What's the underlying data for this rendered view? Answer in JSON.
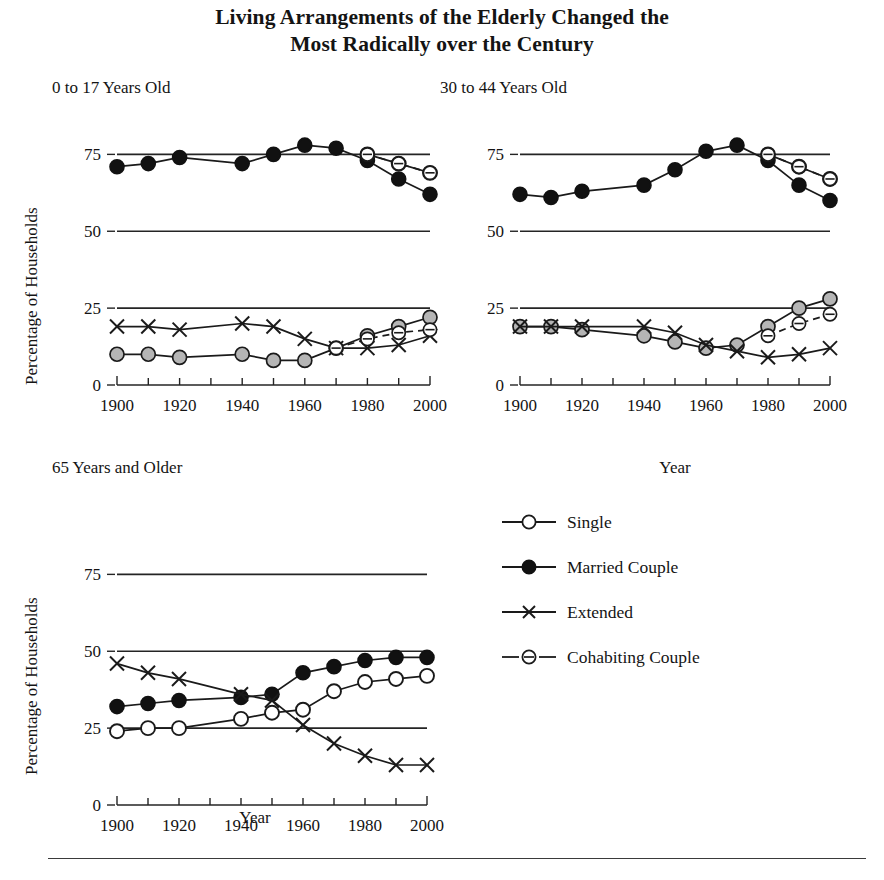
{
  "title": {
    "line1": "Living Arrangements of the Elderly Changed the",
    "line2": "Most Radically over the Century"
  },
  "axis_titles": {
    "y": "Percentage of Households",
    "x": "Year"
  },
  "legend": {
    "items": [
      {
        "label": "Single",
        "marker": "open-circle",
        "line": "solid"
      },
      {
        "label": "Married Couple",
        "marker": "filled-circle",
        "line": "solid"
      },
      {
        "label": "Extended",
        "marker": "cross",
        "line": "solid"
      },
      {
        "label": "Cohabiting Couple",
        "marker": "dashed-circle",
        "line": "dashed"
      }
    ]
  },
  "colors": {
    "ink": "#1a1a1a",
    "single_fill_panel12": "#b5b5b5",
    "single_fill_panel3": "#ffffff",
    "married_fill": "#111111",
    "cohabiting_fill": "#ffffff"
  },
  "chart_data": [
    {
      "type": "line",
      "title": "0 to 17 Years Old",
      "xlabel": "",
      "ylabel": "Percentage of Households",
      "x": [
        1900,
        1910,
        1920,
        1940,
        1950,
        1960,
        1970,
        1980,
        1990,
        2000
      ],
      "xlim": [
        1900,
        2000
      ],
      "ylim": [
        0,
        80
      ],
      "yticks": [
        0,
        25,
        50,
        75
      ],
      "xticks": [
        1900,
        1920,
        1940,
        1960,
        1980,
        2000
      ],
      "xtick_labels": [
        "1900",
        "1920",
        "1940",
        "1960",
        "1980",
        "2000"
      ],
      "ytick_labels": [
        "0",
        "25",
        "50",
        "75"
      ],
      "grid": true,
      "legend_position": "external",
      "series": [
        {
          "name": "Married Couple",
          "marker": "filled-circle",
          "line": "solid",
          "x": [
            1900,
            1910,
            1920,
            1940,
            1950,
            1960,
            1970,
            1980,
            1990,
            2000
          ],
          "values": [
            71,
            72,
            74,
            72,
            75,
            78,
            77,
            73,
            67,
            62
          ]
        },
        {
          "name": "Single",
          "marker": "gray-circle",
          "line": "solid",
          "x": [
            1900,
            1910,
            1920,
            1940,
            1950,
            1960,
            1970,
            1980,
            1990,
            2000
          ],
          "values": [
            10,
            10,
            9,
            10,
            8,
            8,
            12,
            16,
            19,
            22
          ]
        },
        {
          "name": "Extended",
          "marker": "cross",
          "line": "solid",
          "x": [
            1900,
            1910,
            1920,
            1940,
            1950,
            1960,
            1970,
            1980,
            1990,
            2000
          ],
          "values": [
            19,
            19,
            18,
            20,
            19,
            15,
            12,
            12,
            13,
            16
          ]
        },
        {
          "name": "Single (upper)",
          "marker": "open-circle",
          "line": "solid",
          "x": [
            1980,
            1990,
            2000
          ],
          "values": [
            75,
            72,
            69
          ]
        },
        {
          "name": "Cohabiting Couple",
          "marker": "dashed-circle",
          "line": "dashed",
          "x": [
            1980,
            1990,
            2000
          ],
          "values": [
            75,
            72,
            69
          ]
        },
        {
          "name": "Cohabiting Couple (lower)",
          "marker": "dashed-circle",
          "line": "dashed",
          "x": [
            1970,
            1980,
            1990,
            2000
          ],
          "values": [
            12,
            15,
            17,
            18
          ]
        }
      ]
    },
    {
      "type": "line",
      "title": "30 to 44 Years Old",
      "xlabel": "Year",
      "ylabel": "",
      "x": [
        1900,
        1910,
        1920,
        1940,
        1950,
        1960,
        1970,
        1980,
        1990,
        2000
      ],
      "xlim": [
        1900,
        2000
      ],
      "ylim": [
        0,
        80
      ],
      "yticks": [
        0,
        25,
        50,
        75
      ],
      "xticks": [
        1900,
        1920,
        1940,
        1960,
        1980,
        2000
      ],
      "xtick_labels": [
        "1900",
        "1920",
        "1940",
        "1960",
        "1980",
        "2000"
      ],
      "ytick_labels": [
        "0",
        "25",
        "50",
        "75"
      ],
      "grid": true,
      "legend_position": "external",
      "series": [
        {
          "name": "Married Couple",
          "marker": "filled-circle",
          "line": "solid",
          "x": [
            1900,
            1910,
            1920,
            1940,
            1950,
            1960,
            1970,
            1980,
            1990,
            2000
          ],
          "values": [
            62,
            61,
            63,
            65,
            70,
            76,
            78,
            73,
            65,
            60
          ]
        },
        {
          "name": "Single",
          "marker": "gray-circle",
          "line": "solid",
          "x": [
            1900,
            1910,
            1920,
            1940,
            1950,
            1960,
            1970,
            1980,
            1990,
            2000
          ],
          "values": [
            19,
            19,
            18,
            16,
            14,
            12,
            13,
            19,
            25,
            28
          ]
        },
        {
          "name": "Extended",
          "marker": "cross",
          "line": "solid",
          "x": [
            1900,
            1910,
            1920,
            1940,
            1950,
            1960,
            1970,
            1980,
            1990,
            2000
          ],
          "values": [
            19,
            19,
            19,
            19,
            17,
            13,
            11,
            9,
            10,
            12
          ]
        },
        {
          "name": "Single (upper)",
          "marker": "open-circle",
          "line": "solid",
          "x": [
            1980,
            1990,
            2000
          ],
          "values": [
            75,
            71,
            67
          ]
        },
        {
          "name": "Cohabiting Couple",
          "marker": "dashed-circle",
          "line": "dashed",
          "x": [
            1980,
            1990,
            2000
          ],
          "values": [
            75,
            71,
            67
          ]
        },
        {
          "name": "Cohabiting Couple (lower)",
          "marker": "dashed-circle",
          "line": "dashed",
          "x": [
            1980,
            1990,
            2000
          ],
          "values": [
            16,
            20,
            23
          ]
        }
      ]
    },
    {
      "type": "line",
      "title": "65 Years and Older",
      "xlabel": "Year",
      "ylabel": "Percentage of Households",
      "x": [
        1900,
        1910,
        1920,
        1940,
        1950,
        1960,
        1970,
        1980,
        1990,
        2000
      ],
      "xlim": [
        1900,
        2000
      ],
      "ylim": [
        0,
        80
      ],
      "yticks": [
        0,
        25,
        50,
        75
      ],
      "xticks": [
        1900,
        1920,
        1940,
        1960,
        1980,
        2000
      ],
      "xtick_labels": [
        "1900",
        "1920",
        "1940",
        "1960",
        "1980",
        "2000"
      ],
      "ytick_labels": [
        "0",
        "25",
        "50",
        "75"
      ],
      "grid": true,
      "legend_position": "right",
      "series": [
        {
          "name": "Married Couple",
          "marker": "filled-circle",
          "line": "solid",
          "x": [
            1900,
            1910,
            1920,
            1940,
            1950,
            1960,
            1970,
            1980,
            1990,
            2000
          ],
          "values": [
            32,
            33,
            34,
            35,
            36,
            43,
            45,
            47,
            48,
            48
          ]
        },
        {
          "name": "Single",
          "marker": "open-circle",
          "line": "solid",
          "x": [
            1900,
            1910,
            1920,
            1940,
            1950,
            1960,
            1970,
            1980,
            1990,
            2000
          ],
          "values": [
            24,
            25,
            25,
            28,
            30,
            31,
            37,
            40,
            41,
            42
          ]
        },
        {
          "name": "Extended",
          "marker": "cross",
          "line": "solid",
          "x": [
            1900,
            1910,
            1920,
            1940,
            1950,
            1960,
            1970,
            1980,
            1990,
            2000
          ],
          "values": [
            46,
            43,
            41,
            36,
            34,
            26,
            20,
            16,
            13,
            13
          ]
        }
      ]
    }
  ]
}
